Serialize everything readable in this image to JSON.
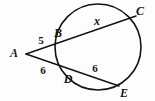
{
  "figure": {
    "background_color": "#fdfdfd",
    "stroke_color": "#141414",
    "circle": {
      "center_x": 98,
      "center_y": 47,
      "radius": 43
    },
    "points": {
      "A": {
        "x": 26,
        "y": 54,
        "label": "A",
        "label_x": 14,
        "label_y": 53
      },
      "B": {
        "x": 60,
        "y": 39,
        "label": "B",
        "label_x": 58,
        "label_y": 33
      },
      "C": {
        "x": 136,
        "y": 16,
        "label": "C",
        "label_x": 140,
        "label_y": 11
      },
      "D": {
        "x": 72,
        "y": 73,
        "label": "D",
        "label_x": 68,
        "label_y": 79
      },
      "E": {
        "x": 119,
        "y": 86,
        "label": "E",
        "label_x": 124,
        "label_y": 93
      }
    },
    "segments": [
      {
        "name": "secant-ABC",
        "from": "A",
        "to": "C"
      },
      {
        "name": "secant-ADE",
        "from": "A",
        "to": "E"
      }
    ],
    "measures": [
      {
        "name": "AB",
        "value": "5",
        "x": 41,
        "y": 40
      },
      {
        "name": "BC",
        "value": "x",
        "x": 97,
        "y": 21
      },
      {
        "name": "AD",
        "value": "6",
        "x": 43,
        "y": 70
      },
      {
        "name": "DE",
        "value": "6",
        "x": 95,
        "y": 68
      }
    ]
  }
}
